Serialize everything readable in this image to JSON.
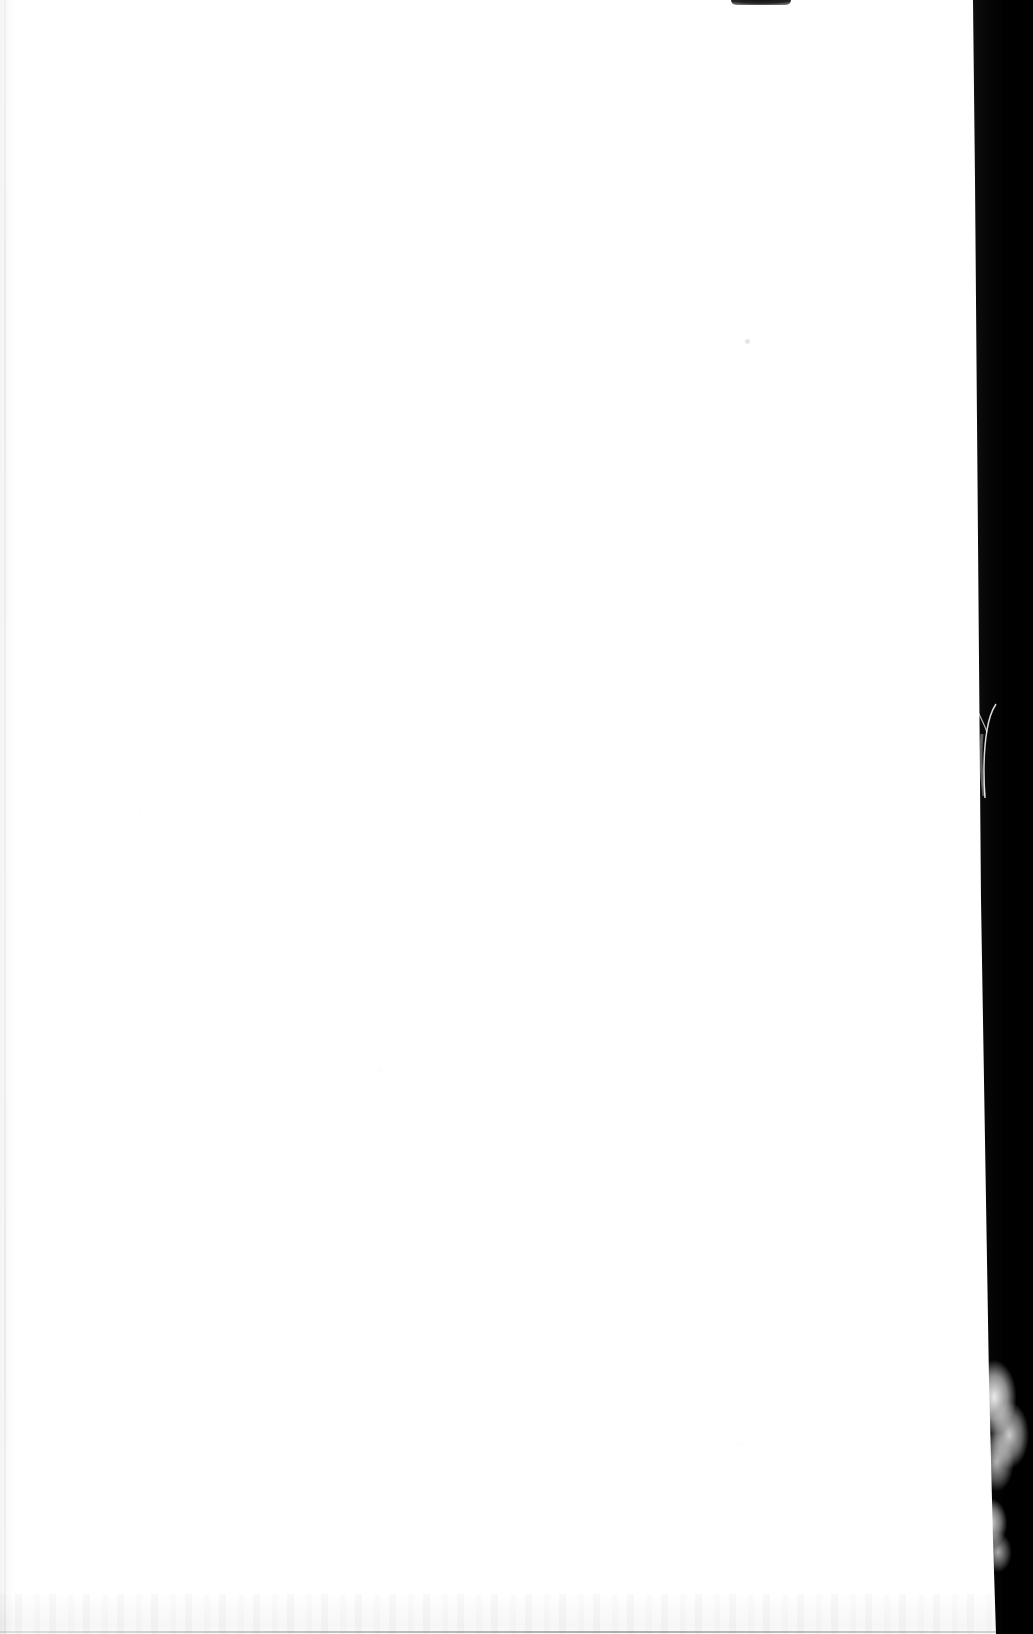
{
  "document": {
    "kind": "scanned-page-image",
    "content_text": "",
    "page_is_blank": true,
    "blank_note": "",
    "width_px": 1033,
    "height_px": 1634
  },
  "scan": {
    "background_color": "#000000",
    "paper_color": "#ffffff",
    "paper_shadow_color": "#f6f6f6",
    "orientation": "portrait"
  },
  "paper": {
    "left_px": 0,
    "top_px": 0,
    "right_edge_top_px": 973,
    "right_edge_bottom_px": 996,
    "bottom_px": 1634,
    "edge_condition": "torn-fibrous-right-edge"
  },
  "artifacts": {
    "top_edge_sliver": {
      "name": "dark-sliver-top-edge",
      "x_px": 731,
      "y_px": 0,
      "width_px": 60,
      "height_px": 5,
      "color": "#0a0a0a"
    },
    "left_scan_line": {
      "name": "vertical-ccd-streak",
      "x_px": 4,
      "width_px": 2,
      "color": "#e8e8e8"
    },
    "dust_speck": {
      "name": "dust-speck",
      "x_px": 744,
      "y_px": 338,
      "diameter_px": 7,
      "color": "#d8d8d8"
    },
    "bottom_band": {
      "name": "bottom-mottle-band",
      "y_px": 1594,
      "height_px": 40,
      "color": "#f1f1f1"
    },
    "fibers": [
      {
        "name": "fiber-wisp-upper",
        "x_px": 964,
        "y_px": 690,
        "width_px": 42,
        "height_px": 110,
        "color": "#ffffff"
      },
      {
        "name": "fiber-tuft-lower",
        "x_px": 972,
        "y_px": 1358,
        "width_px": 62,
        "height_px": 140,
        "color": "#ffffff"
      },
      {
        "name": "fiber-tuft-foot",
        "x_px": 974,
        "y_px": 1492,
        "width_px": 46,
        "height_px": 86,
        "color": "#ffffff"
      }
    ]
  }
}
